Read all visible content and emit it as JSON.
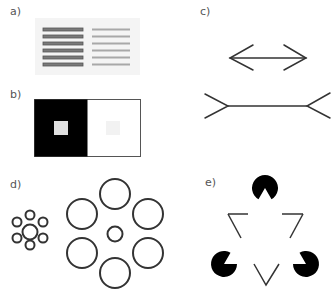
{
  "panels": {
    "a": {
      "label": "a)",
      "title": "Shaded vs plain horizontal bars",
      "bar_count": 6
    },
    "b": {
      "label": "b)",
      "title": "Simultaneous brightness contrast"
    },
    "c": {
      "label": "c)",
      "title": "Müller-Lyer illusion"
    },
    "d": {
      "label": "d)",
      "title": "Ebbinghaus illusion"
    },
    "e": {
      "label": "e)",
      "title": "Kanizsa triangle"
    }
  },
  "colors": {
    "ink": "#333333",
    "dark_bar": "#7a7a7a",
    "light_bar": "#a8a8a8",
    "panel_bg": "#f4f4f4",
    "black": "#000000",
    "gray_square": "#e0e0e0",
    "faint_square": "#f2f2f2"
  }
}
